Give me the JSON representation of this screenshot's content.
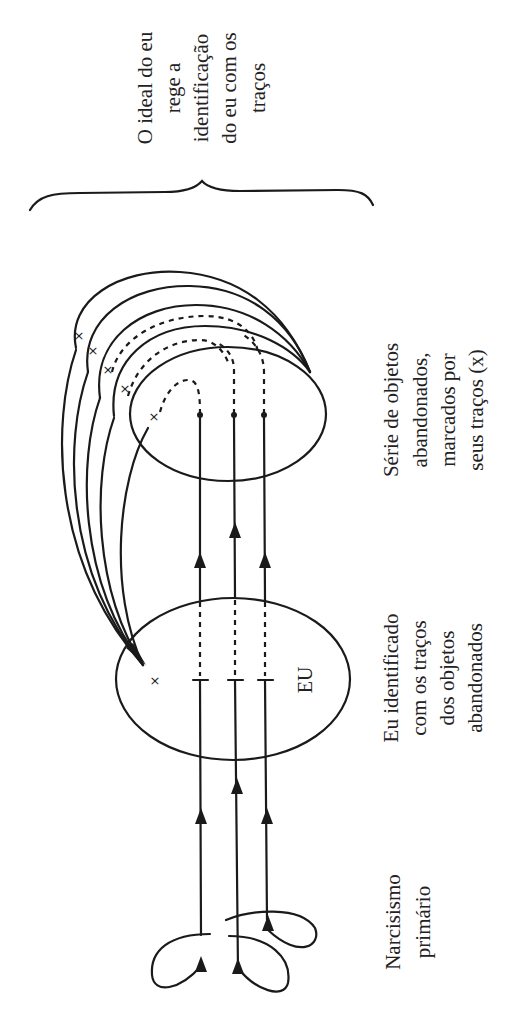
{
  "diagram": {
    "labels": {
      "ideal": [
        "O ideal do eu",
        "rege a",
        "identificação",
        "do eu com os",
        "traços"
      ],
      "objects": [
        "Série de objetos",
        "abandonados,",
        "marcados por",
        "seus traços (x)"
      ],
      "ego": [
        "Eu identificado",
        "com os traços",
        "dos objetos",
        "abandonados"
      ],
      "narcissism": [
        "Narcisismo",
        "primário"
      ]
    },
    "ego_label": "EU",
    "mark_symbol": "×",
    "colors": {
      "ink": "#1a1a1a",
      "background": "#ffffff"
    }
  }
}
